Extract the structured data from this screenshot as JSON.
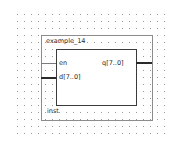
{
  "symbol": {
    "name": "example_14",
    "instance": "inst",
    "inputs": [
      {
        "label": "en",
        "type": "wire"
      },
      {
        "label": "d[7..0]",
        "type": "bus"
      }
    ],
    "outputs": [
      {
        "label": "q[7..0]",
        "type": "bus"
      }
    ]
  },
  "colors": {
    "grid_dot": "#9a9a9a",
    "outer_border": "#8c8c8c",
    "inner_border": "#3a3a3a",
    "bus": "#2a2a2a",
    "wire": "#7a7a7a",
    "text": "#2a2a2a"
  }
}
